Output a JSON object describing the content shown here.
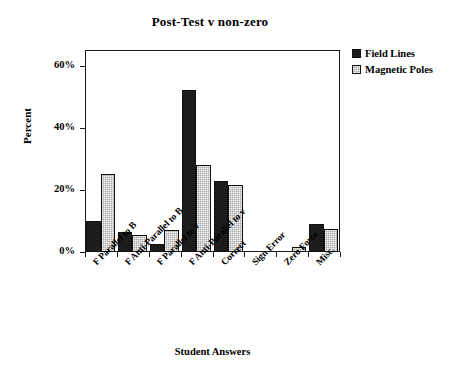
{
  "chart_data": {
    "type": "bar",
    "title": "Post-Test v non-zero",
    "xlabel": "Student Answers",
    "ylabel": "Percent",
    "categories": [
      "F Parallel to B",
      "F Anti-Parallel to B",
      "F Parallel to v",
      "F Anti-Parallel to v",
      "Correct",
      "Sign Error",
      "Zero Force",
      "Misc."
    ],
    "series": [
      {
        "name": "Field Lines",
        "color": "#1c1c1c",
        "values": [
          10,
          6.5,
          2.5,
          52,
          23,
          0,
          0,
          9
        ]
      },
      {
        "name": "Magnetic Poles",
        "color": "#a8a8a8",
        "values": [
          25,
          5.5,
          7,
          28,
          21.5,
          0,
          1.5,
          7.5
        ]
      }
    ],
    "ylim": [
      0,
      65
    ],
    "ytick_values": [
      0,
      20,
      40,
      60
    ],
    "ytick_labels": [
      "0%",
      "20%",
      "40%",
      "60%"
    ],
    "grid": false,
    "legend_position": "top-right"
  }
}
